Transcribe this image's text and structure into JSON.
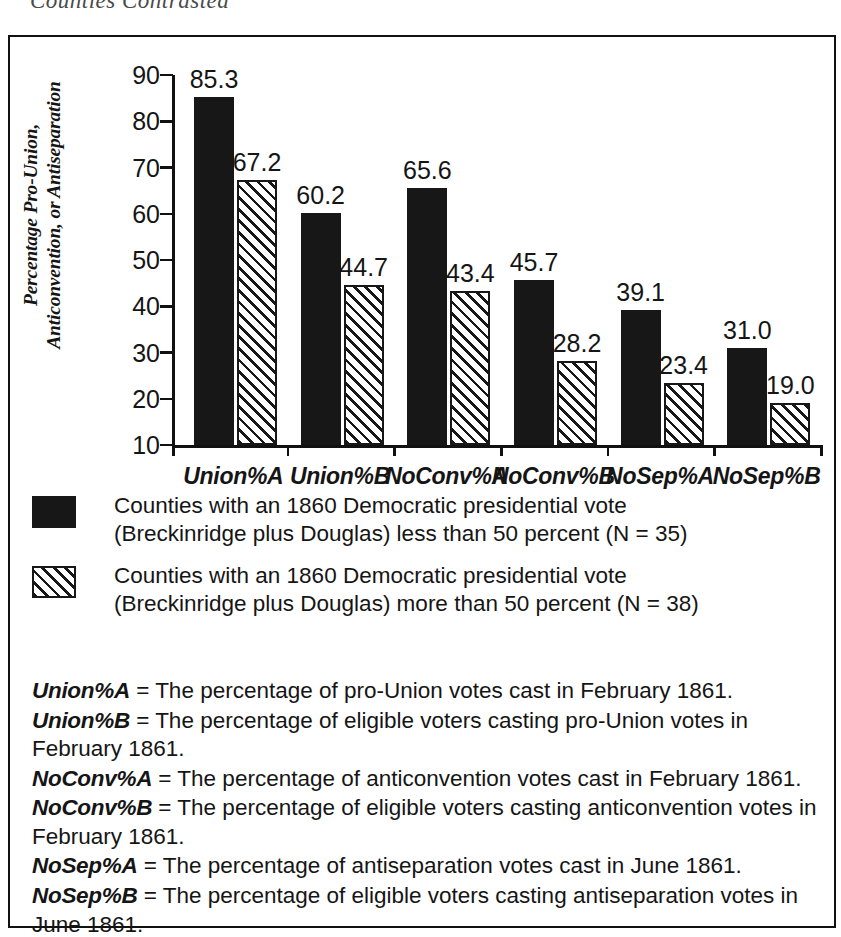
{
  "running_head": "Counties Contrasted",
  "chart_data": {
    "type": "bar",
    "title": "",
    "xlabel": "",
    "ylabel": "Percentage Pro-Union, Anticonvention, or Antiseparation",
    "ylim": [
      10,
      90
    ],
    "yticks": [
      90,
      80,
      70,
      60,
      50,
      40,
      30,
      20,
      10
    ],
    "grid": false,
    "legend_position": "below",
    "categories": [
      "Union%A",
      "Union%B",
      "NoConv%A",
      "NoConv%B",
      "NoSep%A",
      "NoSep%B"
    ],
    "series": [
      {
        "name": "Counties with an 1860 Democratic presidential vote (Breckinridge plus Douglas) less than 50 percent (N = 35)",
        "style": "solid-black",
        "values": [
          85.3,
          60.2,
          65.6,
          45.7,
          39.1,
          31.0
        ],
        "labels": [
          "85.3",
          "60.2",
          "65.6",
          "45.7",
          "39.1",
          "31.0"
        ]
      },
      {
        "name": "Counties with an 1860 Democratic presidential vote (Breckinridge plus Douglas) more than 50 percent (N = 38)",
        "style": "diagonal-hatch",
        "values": [
          67.2,
          44.7,
          43.4,
          28.2,
          23.4,
          19.0
        ],
        "labels": [
          "67.2",
          "44.7",
          "43.4",
          "28.2",
          "23.4",
          "19.0"
        ]
      }
    ]
  },
  "legend": {
    "items": [
      {
        "swatch": "solid-black",
        "text": "Counties with an 1860 Democratic presidential vote (Breckinridge plus Douglas) less than 50 percent (N = 35)"
      },
      {
        "swatch": "diagonal-hatch",
        "text": "Counties with an 1860 Democratic presidential vote (Breckinridge plus Douglas) more than 50 percent (N = 38)"
      }
    ]
  },
  "definitions": [
    {
      "term": "Union%A",
      "text": " = The percentage of pro-Union votes cast in February 1861."
    },
    {
      "term": "Union%B",
      "text": " = The percentage of eligible voters casting pro-Union votes in February 1861."
    },
    {
      "term": "NoConv%A",
      "text": " = The percentage of anticonvention votes cast in February 1861."
    },
    {
      "term": "NoConv%B",
      "text": " = The percentage of eligible voters casting anticonvention votes in February 1861."
    },
    {
      "term": "NoSep%A",
      "text": " = The percentage of antiseparation votes cast in June 1861."
    },
    {
      "term": "NoSep%B",
      "text": " = The percentage of eligible voters casting antiseparation votes in June 1861."
    }
  ],
  "colors": {
    "series_a": "#171717",
    "series_b_line": "#171717",
    "frame": "#111111",
    "text": "#151515",
    "background": "#ffffff"
  }
}
